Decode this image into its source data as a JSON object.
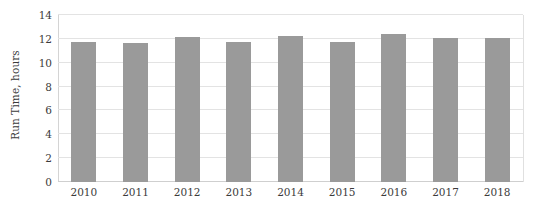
{
  "chart_data": {
    "type": "bar",
    "title": "",
    "subtitle": "",
    "xlabel": "",
    "ylabel": "Run Time, hours",
    "categories": [
      "2010",
      "2011",
      "2012",
      "2013",
      "2014",
      "2015",
      "2016",
      "2017",
      "2018"
    ],
    "values": [
      11.7,
      11.65,
      12.15,
      11.75,
      12.25,
      11.75,
      12.45,
      12.05,
      12.05
    ],
    "series": [
      {
        "name": "Run Time",
        "values": [
          11.7,
          11.65,
          12.15,
          11.75,
          12.25,
          11.75,
          12.45,
          12.05,
          12.05
        ]
      }
    ],
    "ylim": [
      0,
      14
    ],
    "ytick_values": [
      0,
      2,
      4,
      6,
      8,
      10,
      12,
      14
    ],
    "ytick_labels": [
      "0",
      "2",
      "4",
      "6",
      "8",
      "10",
      "12",
      "14"
    ],
    "grid": "horizontal",
    "legend": "none",
    "bar_color": "#9a9a9a",
    "gridline_color": "#e3e3e3",
    "axis_color": "#d4d4d4",
    "text_color": "#3b3b3b",
    "background_color": "#ffffff",
    "annotations": []
  }
}
